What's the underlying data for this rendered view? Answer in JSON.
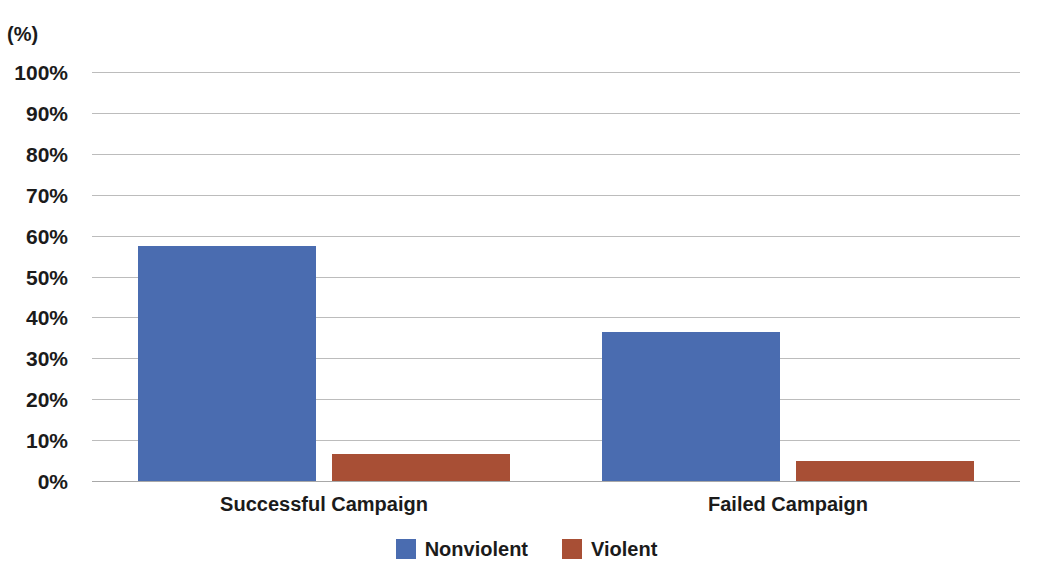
{
  "chart_data": {
    "type": "bar",
    "title": "",
    "subtitle": "",
    "xlabel": "",
    "ylabel": "(%)",
    "axis_unit_label": "(%)",
    "categories": [
      "Successful Campaign",
      "Failed Campaign"
    ],
    "series": [
      {
        "name": "Nonviolent",
        "color": "#4a6cb0",
        "values": [
          57.5,
          36.4
        ]
      },
      {
        "name": "Violent",
        "color": "#a84f35",
        "values": [
          6.6,
          4.9
        ]
      }
    ],
    "ylim": [
      0,
      100
    ],
    "ytick_values": [
      100,
      90,
      80,
      70,
      60,
      50,
      40,
      30,
      20,
      10,
      0
    ],
    "ytick_labels": [
      "100%",
      "90%",
      "80%",
      "70%",
      "60%",
      "50%",
      "40%",
      "30%",
      "20%",
      "10%",
      "0%"
    ],
    "grid": true,
    "grid_color": "#bcbcbc",
    "legend_position": "bottom-center",
    "background_color": "#ffffff",
    "text_color": "#1b1b1b"
  },
  "legend": {
    "items": [
      {
        "label": "Nonviolent",
        "swatch": "nonviolent"
      },
      {
        "label": "Violent",
        "swatch": "violent"
      }
    ]
  }
}
